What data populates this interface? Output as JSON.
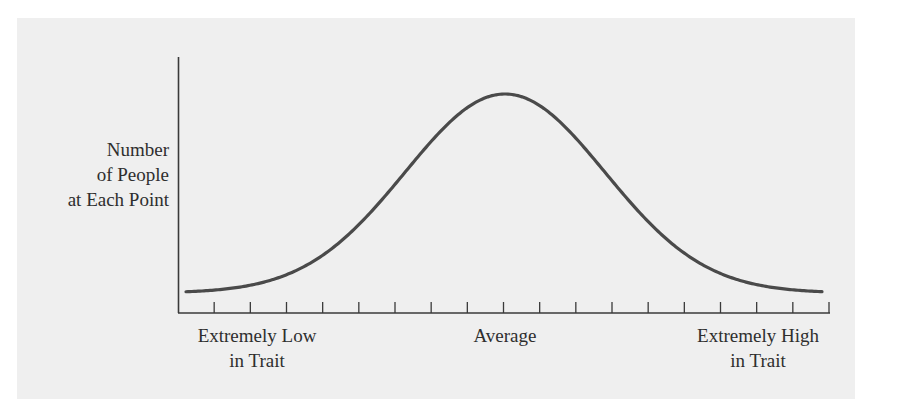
{
  "chart_data": {
    "type": "line",
    "title": "",
    "xlabel": "",
    "ylabel": "Number of People at Each Point",
    "ylabel_lines": [
      "Number",
      "of People",
      "at Each Point"
    ],
    "x_labels": {
      "low": [
        "Extremely Low",
        "in Trait"
      ],
      "average": [
        "Average"
      ],
      "high": [
        "Extremely High",
        "in Trait"
      ]
    },
    "tick_count": 18,
    "grid": false,
    "legend": null,
    "x": [
      -3,
      -2.5,
      -2,
      -1.5,
      -1,
      -0.5,
      0,
      0.5,
      1,
      1.5,
      2,
      2.5,
      3
    ],
    "values": [
      0.01,
      0.04,
      0.14,
      0.32,
      0.61,
      0.88,
      1.0,
      0.88,
      0.61,
      0.32,
      0.14,
      0.04,
      0.01
    ],
    "colors": {
      "curve": "#4a4a4a",
      "axis": "#3a3a3a",
      "background": "#efefef"
    }
  }
}
